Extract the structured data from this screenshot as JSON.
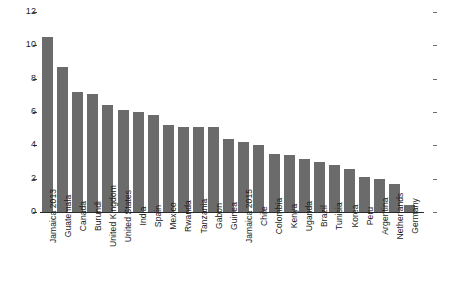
{
  "chart_data": {
    "type": "bar",
    "title": "",
    "subtitle": "",
    "xlabel": "",
    "ylabel": "",
    "ylim": [
      0,
      12
    ],
    "yticks": [
      0,
      2,
      4,
      6,
      8,
      10,
      12
    ],
    "ytick_labels": [
      "0",
      "2",
      "4",
      "6",
      "8",
      "10",
      "12"
    ],
    "grid": false,
    "legend": null,
    "bar_color": "#6b6b6b",
    "background_color": "#ffffff",
    "axis_color": "#2b2b2b",
    "categories": [
      "Jamaica 2013",
      "Guatemala",
      "Canada",
      "Burundi",
      "United Kingdom",
      "United States",
      "India",
      "Spain",
      "Mexico",
      "Rwanda",
      "Tanzania",
      "Gabon",
      "Guinea",
      "Jamaica 2015",
      "Chile",
      "Colombia",
      "Kenya",
      "Uganda",
      "Brazil",
      "Tunisia",
      "Korea",
      "Peru",
      "Argentina",
      "Netherlands",
      "Germany"
    ],
    "values": [
      10.5,
      8.7,
      7.2,
      7.1,
      6.4,
      6.1,
      6.0,
      5.8,
      5.2,
      5.1,
      5.1,
      5.1,
      4.4,
      4.2,
      4.0,
      3.5,
      3.4,
      3.2,
      3.0,
      2.8,
      2.6,
      2.1,
      2.0,
      1.7,
      0.4
    ]
  }
}
